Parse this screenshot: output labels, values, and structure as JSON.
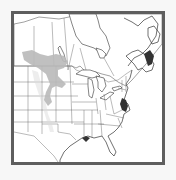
{
  "map": {
    "title": "Species range map — eastern North America",
    "region": "Eastern United States and southern Canada",
    "range_label": "Northern Great Plains range",
    "colors": {
      "frame": "#5e5e5e",
      "range": "#b9b9b9",
      "land": "#ffffff",
      "lines": "#555555",
      "background": "#f7f7f7"
    }
  }
}
